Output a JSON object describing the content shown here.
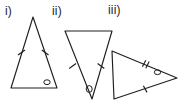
{
  "figure": {
    "background_color": "#ffffff",
    "stroke_color": "#1f1f1f",
    "stroke_width": 1.1,
    "canvas": {
      "width": 182,
      "height": 108
    }
  },
  "labels": [
    {
      "id": "i",
      "text": "i)",
      "x": 5,
      "y": 5
    },
    {
      "id": "ii",
      "text": "ii)",
      "x": 52,
      "y": 5
    },
    {
      "id": "iii",
      "text": "iii)",
      "x": 108,
      "y": 4
    }
  ],
  "triangles": [
    {
      "id": "triangle-i",
      "label": "i)",
      "orientation": "apex-up",
      "vertices": [
        {
          "name": "apex",
          "x": 33,
          "y": 17
        },
        {
          "name": "bottom-left",
          "x": 11,
          "y": 88
        },
        {
          "name": "bottom-right",
          "x": 57,
          "y": 88
        }
      ],
      "tick_marks": [
        {
          "side": "left-leg",
          "count": 1,
          "x": 21.5,
          "y": 52.5
        },
        {
          "side": "right-leg",
          "count": 1,
          "x": 45.0,
          "y": 52.5
        }
      ],
      "angle_marks": [
        {
          "at_vertex": "bottom-right",
          "shape": "oval",
          "cx": 47,
          "cy": 82,
          "rx": 3.2,
          "ry": 2.4
        }
      ]
    },
    {
      "id": "triangle-ii",
      "label": "ii)",
      "orientation": "apex-down",
      "vertices": [
        {
          "name": "top-left",
          "x": 65,
          "y": 31
        },
        {
          "name": "top-right",
          "x": 112,
          "y": 31
        },
        {
          "name": "apex",
          "x": 92,
          "y": 99
        }
      ],
      "tick_marks": [
        {
          "side": "left-leg",
          "count": 1,
          "x": 72.5,
          "y": 66.0
        },
        {
          "side": "right-leg",
          "count": 1,
          "x": 101.0,
          "y": 66.0
        }
      ],
      "angle_marks": [
        {
          "at_vertex": "apex",
          "shape": "oval",
          "cx": 89,
          "cy": 89,
          "rx": 3.0,
          "ry": 3.4
        }
      ]
    },
    {
      "id": "triangle-iii",
      "label": "iii)",
      "orientation": "apex-right",
      "vertices": [
        {
          "name": "top-left",
          "x": 112,
          "y": 51
        },
        {
          "name": "bottom-left",
          "x": 114,
          "y": 99
        },
        {
          "name": "apex",
          "x": 177,
          "y": 78
        }
      ],
      "tick_marks": [
        {
          "side": "upper-leg",
          "count": 2,
          "x": 145.0,
          "y": 64.0
        },
        {
          "side": "lower-leg",
          "count": 1,
          "x": 146.0,
          "y": 89.0
        }
      ],
      "angle_marks": [
        {
          "at_vertex": "apex",
          "shape": "oval",
          "cx": 157,
          "cy": 72,
          "rx": 3.2,
          "ry": 2.4
        }
      ]
    }
  ]
}
